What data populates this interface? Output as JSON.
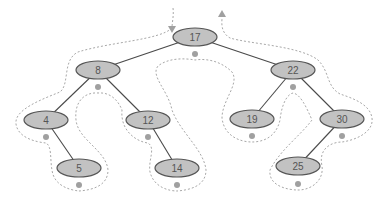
{
  "diagram": {
    "type": "binary-search-tree-inorder-traversal",
    "colors": {
      "node_fill": "#c2c2c2",
      "node_stroke": "#555555",
      "edge": "#4a4a4a",
      "tour_path": "#a8a8a8",
      "visit_dot": "#a0a0a0",
      "label": "#555555"
    },
    "nodes": [
      {
        "id": "n17",
        "label": "17",
        "x": 195,
        "y": 37
      },
      {
        "id": "n8",
        "label": "8",
        "x": 98,
        "y": 70
      },
      {
        "id": "n22",
        "label": "22",
        "x": 293,
        "y": 70
      },
      {
        "id": "n4",
        "label": "4",
        "x": 46,
        "y": 120
      },
      {
        "id": "n12",
        "label": "12",
        "x": 148,
        "y": 120
      },
      {
        "id": "n19",
        "label": "19",
        "x": 252,
        "y": 119
      },
      {
        "id": "n30",
        "label": "30",
        "x": 342,
        "y": 119
      },
      {
        "id": "n5",
        "label": "5",
        "x": 79,
        "y": 168
      },
      {
        "id": "n14",
        "label": "14",
        "x": 177,
        "y": 168
      },
      {
        "id": "n25",
        "label": "25",
        "x": 298,
        "y": 166
      }
    ],
    "edges": [
      {
        "from": "n17",
        "to": "n8"
      },
      {
        "from": "n17",
        "to": "n22"
      },
      {
        "from": "n8",
        "to": "n4"
      },
      {
        "from": "n8",
        "to": "n12"
      },
      {
        "from": "n4",
        "to": "n5"
      },
      {
        "from": "n12",
        "to": "n14"
      },
      {
        "from": "n22",
        "to": "n19"
      },
      {
        "from": "n22",
        "to": "n30"
      },
      {
        "from": "n30",
        "to": "n25"
      }
    ],
    "visit_dots": [
      {
        "node": "n4",
        "x": 46,
        "y": 137
      },
      {
        "node": "n5",
        "x": 79,
        "y": 185
      },
      {
        "node": "n8",
        "x": 98,
        "y": 87
      },
      {
        "node": "n12",
        "x": 148,
        "y": 137
      },
      {
        "node": "n14",
        "x": 177,
        "y": 185
      },
      {
        "node": "n17",
        "x": 195,
        "y": 54
      },
      {
        "node": "n19",
        "x": 252,
        "y": 136
      },
      {
        "node": "n22",
        "x": 293,
        "y": 87
      },
      {
        "node": "n25",
        "x": 298,
        "y": 184
      },
      {
        "node": "n30",
        "x": 342,
        "y": 136
      }
    ],
    "start_arrow": {
      "direction": "down",
      "x": 172,
      "y": 30
    },
    "end_arrow": {
      "direction": "up",
      "x": 222,
      "y": 14
    }
  }
}
